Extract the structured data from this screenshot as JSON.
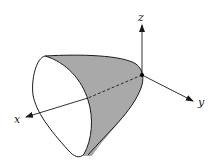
{
  "diagram": {
    "type": "3d-surface-paraboloid",
    "axes": {
      "x_label": "x",
      "y_label": "y",
      "z_label": "z"
    },
    "colors": {
      "surface_fill": "#a9a9a9",
      "stroke": "#1a1a1a",
      "background": "#ffffff"
    }
  }
}
